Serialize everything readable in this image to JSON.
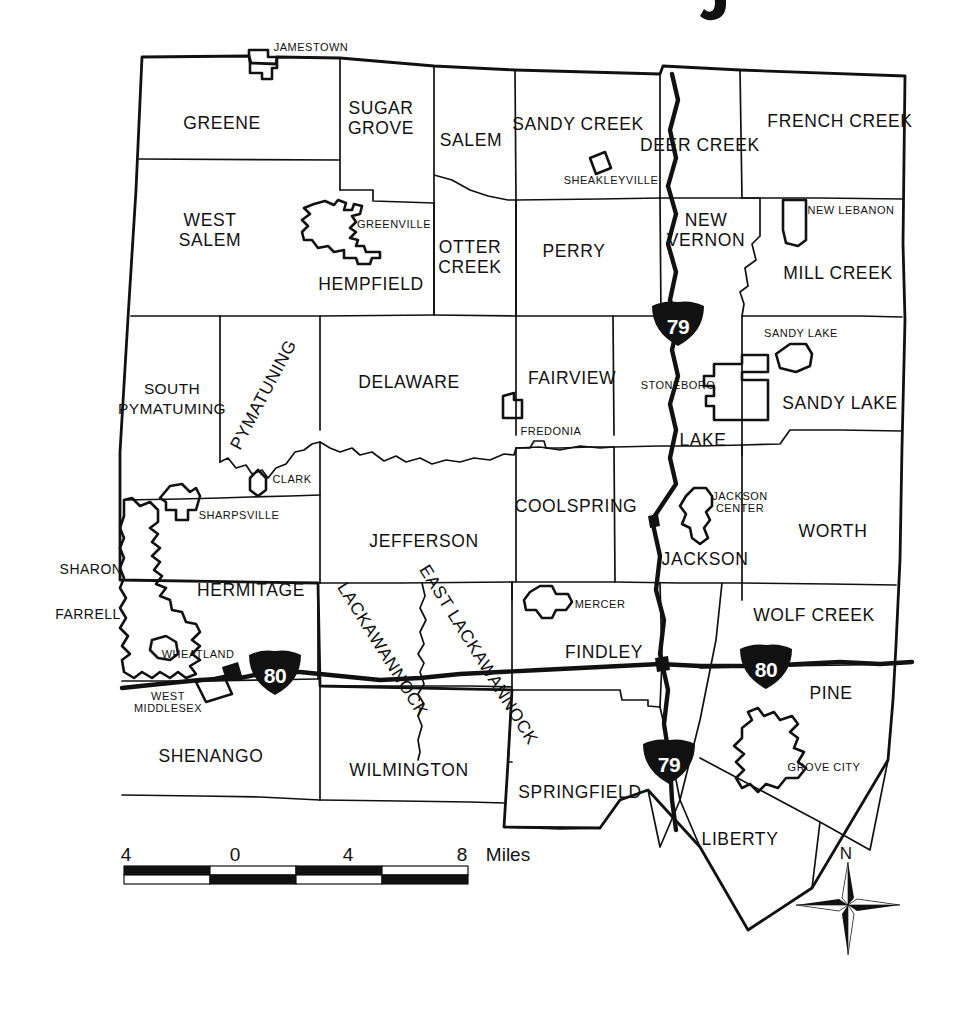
{
  "map": {
    "title_fragment": "y",
    "subject": "Mercer County Pennsylvania municipalities",
    "background_color": "#ffffff",
    "line_color": "#111111"
  },
  "townships": [
    {
      "name": "GREENE",
      "x": 222,
      "y": 124
    },
    {
      "name": "SUGAR\nGROVE",
      "x": 381,
      "y": 119
    },
    {
      "name": "SALEM",
      "x": 471,
      "y": 141
    },
    {
      "name": "SANDY CREEK",
      "x": 578,
      "y": 125
    },
    {
      "name": "DEER CREEK",
      "x": 700,
      "y": 146
    },
    {
      "name": "FRENCH CREEK",
      "x": 840,
      "y": 122
    },
    {
      "name": "WEST\nSALEM",
      "x": 210,
      "y": 231
    },
    {
      "name": "HEMPFIELD",
      "x": 371,
      "y": 285
    },
    {
      "name": "OTTER\nCREEK",
      "x": 470,
      "y": 258
    },
    {
      "name": "PERRY",
      "x": 574,
      "y": 252
    },
    {
      "name": "NEW\nVERNON",
      "x": 706,
      "y": 231
    },
    {
      "name": "MILL CREEK",
      "x": 838,
      "y": 274
    },
    {
      "name": "SOUTH\nPYMATUMING",
      "x": 172,
      "y": 400
    },
    {
      "name": "PYMATUNING",
      "x": 264,
      "y": 395,
      "rotate": -62
    },
    {
      "name": "DELAWARE",
      "x": 409,
      "y": 383
    },
    {
      "name": "FAIRVIEW",
      "x": 572,
      "y": 379
    },
    {
      "name": "SANDY LAKE",
      "x": 840,
      "y": 404
    },
    {
      "name": "LAKE",
      "x": 703,
      "y": 441
    },
    {
      "name": "JEFFERSON",
      "x": 424,
      "y": 542
    },
    {
      "name": "COOLSPRING",
      "x": 576,
      "y": 507
    },
    {
      "name": "JACKSON",
      "x": 705,
      "y": 560
    },
    {
      "name": "WORTH",
      "x": 833,
      "y": 532
    },
    {
      "name": "HERMITAGE",
      "x": 251,
      "y": 591
    },
    {
      "name": "LACKAWANNOCK",
      "x": 382,
      "y": 650,
      "rotate": 58
    },
    {
      "name": "EAST LACKAWANNOCK",
      "x": 478,
      "y": 655,
      "rotate": 58
    },
    {
      "name": "FINDLEY",
      "x": 604,
      "y": 653
    },
    {
      "name": "WOLF CREEK",
      "x": 814,
      "y": 616
    },
    {
      "name": "PINE",
      "x": 831,
      "y": 694
    },
    {
      "name": "SHENANGO",
      "x": 211,
      "y": 757
    },
    {
      "name": "WILMINGTON",
      "x": 409,
      "y": 771
    },
    {
      "name": "SPRINGFIELD",
      "x": 580,
      "y": 793
    },
    {
      "name": "LIBERTY",
      "x": 740,
      "y": 840
    }
  ],
  "boroughs": [
    {
      "name": "JAMESTOWN",
      "x": 311,
      "y": 48
    },
    {
      "name": "SHEAKLEYVILLE",
      "x": 611,
      "y": 181
    },
    {
      "name": "GREENVILLE",
      "x": 394,
      "y": 225
    },
    {
      "name": "NEW LEBANON",
      "x": 851,
      "y": 211
    },
    {
      "name": "SANDY LAKE",
      "x": 801,
      "y": 334
    },
    {
      "name": "CLARK",
      "x": 292,
      "y": 480
    },
    {
      "name": "FREDONIA",
      "x": 551,
      "y": 432
    },
    {
      "name": "STONEBORO",
      "x": 678,
      "y": 386
    },
    {
      "name": "JACKSON\nCENTER",
      "x": 740,
      "y": 503
    },
    {
      "name": "SHARPSVILLE",
      "x": 239,
      "y": 516
    },
    {
      "name": "MERCER",
      "x": 600,
      "y": 605
    },
    {
      "name": "WHEATLAND",
      "x": 198,
      "y": 655
    },
    {
      "name": "WEST\nMIDDLESEX",
      "x": 168,
      "y": 703
    },
    {
      "name": "GROVE CITY",
      "x": 824,
      "y": 768
    }
  ],
  "cities": [
    {
      "name": "SHARON",
      "x": 91,
      "y": 570
    },
    {
      "name": "FARRELL",
      "x": 88,
      "y": 615
    }
  ],
  "highways": [
    {
      "route": "79",
      "shield_x": 678,
      "shield_y": 324
    },
    {
      "route": "79",
      "shield_x": 669,
      "shield_y": 762
    },
    {
      "route": "80",
      "shield_x": 275,
      "shield_y": 673
    },
    {
      "route": "80",
      "shield_x": 766,
      "shield_y": 667
    }
  ],
  "scale_bar": {
    "labels": [
      "4",
      "0",
      "4",
      "8"
    ],
    "unit": "Miles",
    "label_positions": [
      126,
      235,
      348,
      462
    ],
    "unit_x": 508,
    "label_y": 856,
    "bar_x": 124,
    "bar_y": 866,
    "bar_width": 344,
    "bar_height": 18,
    "segments": 4
  },
  "compass": {
    "label": "N",
    "label_x": 846,
    "label_y": 855,
    "center_x": 848,
    "center_y": 905,
    "radius": 52
  }
}
